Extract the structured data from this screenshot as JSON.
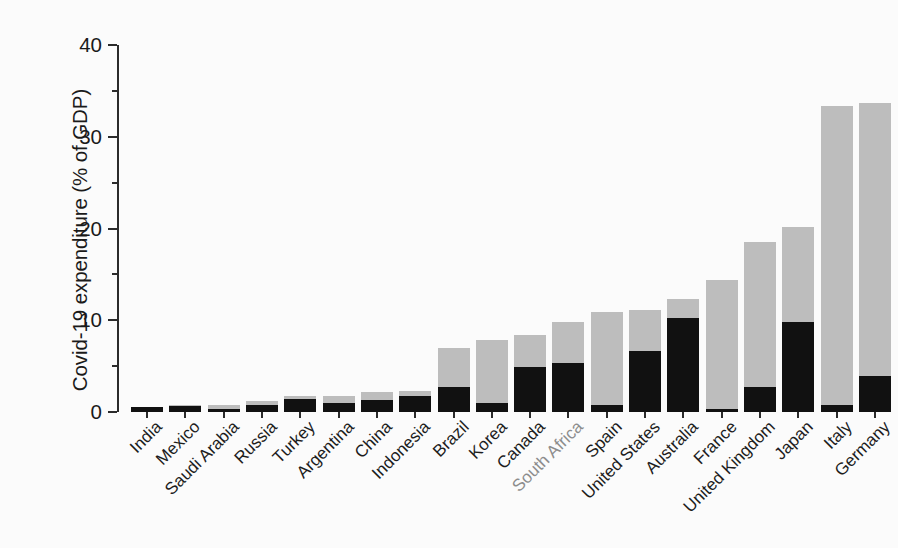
{
  "chart_data": {
    "type": "bar",
    "subtype": "stacked-bar",
    "title": "",
    "subtitle": "",
    "xlabel": "",
    "ylabel": "Covid-19 expenditure (% of GDP)",
    "ylim": [
      0,
      40
    ],
    "yticks": [
      0,
      10,
      20,
      30,
      40
    ],
    "ytick_labels": [
      "0",
      "10",
      "20",
      "30",
      "40"
    ],
    "y_minor_ticks": [
      5,
      15,
      25,
      35
    ],
    "grid": false,
    "legend_position": "none",
    "categories": [
      "India",
      "Mexico",
      "Saudi Arabia",
      "Russia",
      "Turkey",
      "Argentina",
      "China",
      "Indonesia",
      "Brazil",
      "Korea",
      "Canada",
      "South Africa",
      "Spain",
      "United States",
      "Australia",
      "France",
      "United Kingdom",
      "Japan",
      "Italy",
      "Germany"
    ],
    "highlighted_category": "South Africa",
    "series": [
      {
        "name": "Additional spending and forgone revenue",
        "color": "#111111",
        "values": [
          0.5,
          0.7,
          0.3,
          0.8,
          1.4,
          1.0,
          1.3,
          1.7,
          2.7,
          1.0,
          4.9,
          5.3,
          0.8,
          6.7,
          10.3,
          0.3,
          2.7,
          9.8,
          0.8,
          3.9
        ]
      },
      {
        "name": "Liquidity support (loans, guarantees, equity)",
        "color": "#bdbdbd",
        "values": [
          0.1,
          0.1,
          0.5,
          0.4,
          0.4,
          0.8,
          0.9,
          0.6,
          4.3,
          6.8,
          3.5,
          4.5,
          10.1,
          4.4,
          2.0,
          14.1,
          15.8,
          10.4,
          32.5,
          29.8
        ]
      }
    ],
    "totals": [
      0.6,
      0.8,
      0.8,
      1.2,
      1.8,
      1.8,
      2.2,
      2.3,
      7.0,
      7.8,
      8.4,
      9.8,
      10.9,
      11.1,
      12.3,
      14.4,
      18.5,
      20.2,
      33.3,
      33.7
    ]
  },
  "axis": {
    "y_title": "Covid-19 expenditure (% of GDP)"
  }
}
